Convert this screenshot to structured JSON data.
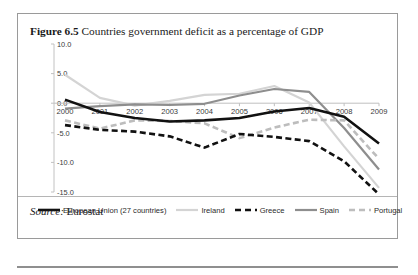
{
  "figure": {
    "label": "Figure 6.5",
    "caption": "Countries government deficit as a percentage of GDP",
    "source_key": "Source:",
    "source_value": "Eurostat"
  },
  "chart_data": {
    "type": "line",
    "title": "Countries government deficit as a percentage of GDP",
    "xlabel": "",
    "ylabel": "",
    "x": [
      2000,
      2001,
      2002,
      2003,
      2004,
      2005,
      2006,
      2007,
      2008,
      2009
    ],
    "xtick_labels": [
      "2000",
      "2001",
      "2002",
      "2003",
      "2004",
      "2005",
      "2006",
      "2007",
      "2008",
      "2009"
    ],
    "ytick_labels": [
      "10.0",
      "5.0",
      "0.0",
      "-5.0",
      "-10.0",
      "-15.0"
    ],
    "yticks": [
      10.0,
      5.0,
      0.0,
      -5.0,
      -10.0,
      -15.0
    ],
    "ylim": [
      -15.0,
      10.0
    ],
    "grid": false,
    "zero_line": true,
    "legend_position": "bottom",
    "series": [
      {
        "name": "European Union (27 countries)",
        "color": "#111111",
        "style": "solid",
        "width": 2.6,
        "values": [
          0.6,
          -1.5,
          -2.5,
          -3.1,
          -2.9,
          -2.5,
          -1.4,
          -0.8,
          -2.3,
          -6.8
        ]
      },
      {
        "name": "Ireland",
        "color": "#d4d4d4",
        "style": "solid",
        "width": 2.2,
        "values": [
          4.8,
          0.9,
          -0.4,
          0.4,
          1.4,
          1.6,
          2.9,
          0.1,
          -7.3,
          -14.3
        ]
      },
      {
        "name": "Greece",
        "color": "#111111",
        "style": "dashed",
        "width": 2.6,
        "values": [
          -3.7,
          -4.5,
          -4.8,
          -5.6,
          -7.5,
          -5.2,
          -5.7,
          -6.4,
          -9.8,
          -15.4
        ]
      },
      {
        "name": "Spain",
        "color": "#8e8e8e",
        "style": "solid",
        "width": 2.2,
        "values": [
          -0.9,
          -0.5,
          -0.2,
          -0.3,
          -0.1,
          1.3,
          2.4,
          1.9,
          -4.2,
          -11.2
        ]
      },
      {
        "name": "Portugal",
        "color": "#bdbdbd",
        "style": "dashed",
        "width": 2.6,
        "values": [
          -2.9,
          -4.3,
          -2.9,
          -3.0,
          -3.4,
          -5.9,
          -4.1,
          -2.8,
          -2.9,
          -9.4
        ]
      }
    ]
  }
}
